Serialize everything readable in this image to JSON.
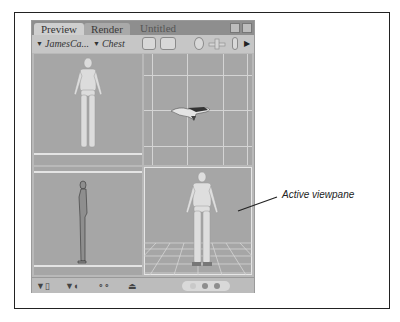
{
  "window": {
    "title": "Untitled",
    "tabs": [
      {
        "label": "Preview",
        "active": true
      },
      {
        "label": "Render",
        "active": false
      }
    ]
  },
  "menus": {
    "figure_dropdown": "JamesCa...",
    "part_dropdown": "Chest"
  },
  "toolbar_icons": [
    "camera-icon",
    "camera-select-icon",
    "sphere-icon",
    "move-icon",
    "capsule-icon",
    "arrow-right-icon"
  ],
  "viewpanes": [
    {
      "name": "front-view",
      "view": "front"
    },
    {
      "name": "top-view",
      "view": "top"
    },
    {
      "name": "side-view",
      "view": "side"
    },
    {
      "name": "perspective-view",
      "view": "perspective",
      "active": true
    }
  ],
  "bottom_icons": [
    "layout-dropdown-icon",
    "render-style-dropdown-icon",
    "lights-icon",
    "floor-icon"
  ],
  "callout": {
    "label": "Active viewpane"
  },
  "colors": {
    "panel_bg": "#b9b9b9",
    "pane_bg": "#a6a6a6",
    "grid_line": "#d4d4d4"
  }
}
